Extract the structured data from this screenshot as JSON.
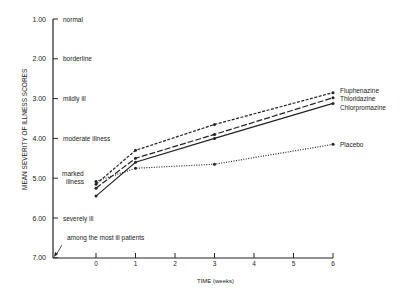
{
  "chart_data": {
    "type": "line",
    "title": "",
    "xlabel": "TIME (weeks)",
    "ylabel": "MEAN SEVERITY OF ILLNESS SCORES",
    "x": [
      0,
      1,
      3,
      6
    ],
    "xticks": [
      "0",
      "1",
      "2",
      "3",
      "4",
      "5",
      "6"
    ],
    "yticks": [
      "1.00",
      "2.00",
      "3.00",
      "4.00",
      "5.00",
      "6.00",
      "7.00"
    ],
    "ylim": [
      7.0,
      1.0
    ],
    "y_inverted": true,
    "y_category_labels": [
      {
        "value": 1.0,
        "label": "normal"
      },
      {
        "value": 2.0,
        "label": "borderline"
      },
      {
        "value": 3.0,
        "label": "mildly ill"
      },
      {
        "value": 4.0,
        "label": "moderate illness"
      },
      {
        "value": 5.0,
        "label": "marked illness"
      },
      {
        "value": 6.0,
        "label": "severely ill"
      },
      {
        "value": 7.0,
        "label": "among the most ill patients"
      }
    ],
    "series": [
      {
        "name": "Fluphenazine",
        "style": "dashed",
        "values": [
          5.15,
          4.3,
          3.65,
          2.85
        ]
      },
      {
        "name": "Thioridazine",
        "style": "long-dash",
        "values": [
          5.25,
          4.5,
          3.9,
          2.98
        ]
      },
      {
        "name": "Chlorpromazine",
        "style": "solid",
        "values": [
          5.45,
          4.6,
          4.0,
          3.12
        ]
      },
      {
        "name": "Placebo",
        "style": "dotted",
        "values": [
          5.08,
          4.75,
          4.65,
          4.15
        ]
      }
    ],
    "grid": false,
    "legend_position": "inline-right"
  }
}
